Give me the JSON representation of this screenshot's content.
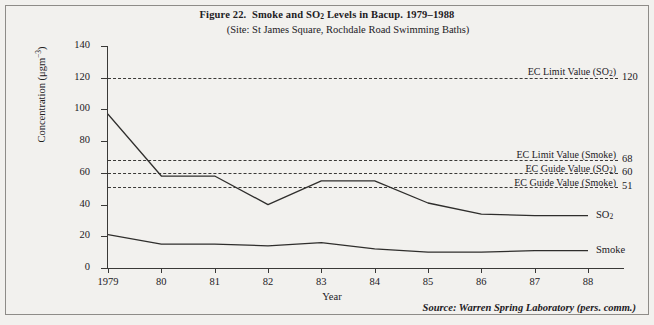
{
  "figure": {
    "title_prefix": "Figure 22.",
    "title_main": "Smoke and SO",
    "title_sub": "2",
    "title_rest": " Levels in Bacup. 1979–1988",
    "subtitle": "(Site: St James Square, Rochdale Road Swimming Baths)",
    "source": "Source: Warren Spring Laboratory (pers. comm.)"
  },
  "chart_data": {
    "type": "line",
    "subtitle": "(Site: St James Square, Rochdale Road Swimming Baths)",
    "xlabel": "Year",
    "ylabel": "Concentration (μgm⁻³)",
    "x": [
      1979,
      1980,
      1981,
      1982,
      1983,
      1984,
      1985,
      1986,
      1987,
      1988
    ],
    "xticklabels": [
      "1979",
      "80",
      "81",
      "82",
      "83",
      "84",
      "85",
      "86",
      "87",
      "88"
    ],
    "yticks": [
      0,
      20,
      40,
      60,
      80,
      100,
      120,
      140
    ],
    "yticklabels": [
      "0",
      "20",
      "40",
      "60",
      "80",
      "100",
      "120",
      "140"
    ],
    "ylim": [
      0,
      140
    ],
    "grid": false,
    "legend": "inline-right",
    "series": [
      {
        "name": "SO2",
        "label": "SO",
        "label_sub": "2",
        "values": [
          97,
          58,
          58,
          40,
          55,
          55,
          41,
          34,
          33,
          33
        ]
      },
      {
        "name": "Smoke",
        "label": "Smoke",
        "label_sub": "",
        "values": [
          21,
          15,
          15,
          14,
          16,
          12,
          10,
          10,
          11,
          11
        ]
      }
    ],
    "reference_lines": [
      {
        "name": "EC Limit Value (SO2)",
        "label": "EC Limit Value (SO",
        "label_sub": "2",
        "label_end": ")",
        "value": 120,
        "value_text": "120"
      },
      {
        "name": "EC Limit Value (Smoke)",
        "label": "EC Limit Value (Smoke)",
        "label_sub": "",
        "label_end": "",
        "value": 68,
        "value_text": "68"
      },
      {
        "name": "EC Guide Value (SO2)",
        "label": "EC Guide Value (SO",
        "label_sub": "2",
        "label_end": ")",
        "value": 60,
        "value_text": "60"
      },
      {
        "name": "EC Guide Value (Smoke)",
        "label": "EC Guide Value (Smoke)",
        "label_sub": "",
        "label_end": "",
        "value": 51,
        "value_text": "51"
      }
    ]
  },
  "colors": {
    "background": "#f2f1ee",
    "ink": "#22201e",
    "line": "#3a3937",
    "border": "#8e8c88"
  }
}
